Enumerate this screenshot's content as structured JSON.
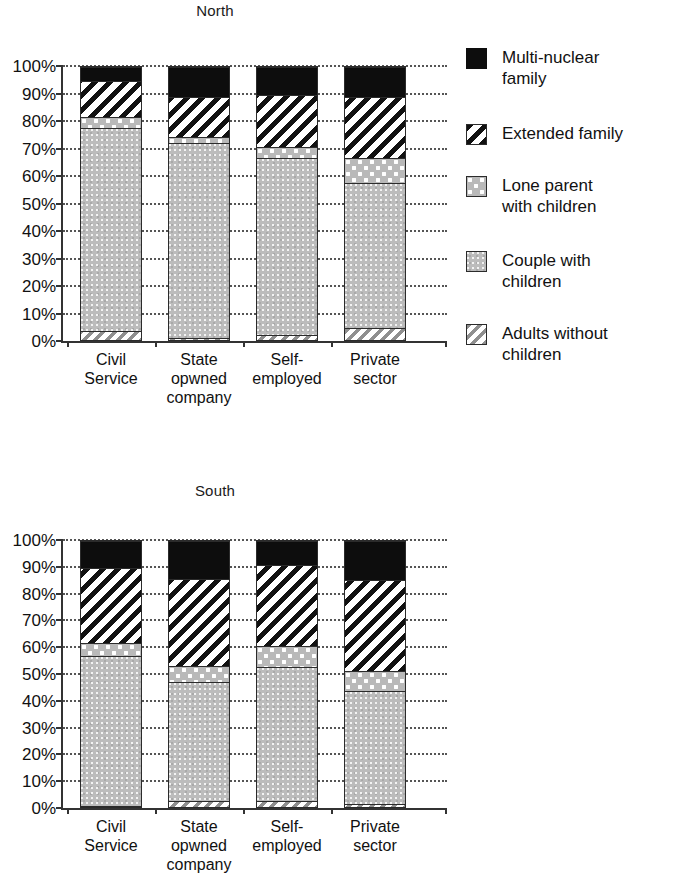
{
  "chart_data": [
    {
      "type": "bar",
      "title": "North",
      "xlabel": "",
      "ylabel": "",
      "ylim": [
        0,
        100
      ],
      "stacked": true,
      "grid": true,
      "legend_position": "right",
      "categories": [
        "Civil Service",
        "State opwned company",
        "Self-employed",
        "Private sector"
      ],
      "tick_labels": [
        "0%",
        "10%",
        "20%",
        "30%",
        "40%",
        "50%",
        "60%",
        "70%",
        "80%",
        "90%",
        "100%"
      ],
      "series": [
        {
          "name": "Adults without children",
          "values": [
            4,
            1.5,
            2.5,
            5
          ]
        },
        {
          "name": "Couple with children",
          "values": [
            74,
            71,
            64.5,
            53
          ]
        },
        {
          "name": "Lone parent with children",
          "values": [
            4,
            2,
            4,
            9
          ]
        },
        {
          "name": "Extended family",
          "values": [
            13,
            14.5,
            19,
            22
          ]
        },
        {
          "name": "Multi-nuclear family",
          "values": [
            5,
            11,
            10,
            11
          ]
        }
      ]
    },
    {
      "type": "bar",
      "title": "South",
      "xlabel": "",
      "ylabel": "",
      "ylim": [
        0,
        100
      ],
      "stacked": true,
      "grid": true,
      "legend_position": "right",
      "categories": [
        "Civil Service",
        "State opwned company",
        "Self-employed",
        "Private sector"
      ],
      "tick_labels": [
        "0%",
        "10%",
        "20%",
        "30%",
        "40%",
        "50%",
        "60%",
        "70%",
        "80%",
        "90%",
        "100%"
      ],
      "series": [
        {
          "name": "Adults without children",
          "values": [
            1,
            3,
            3,
            2
          ]
        },
        {
          "name": "Couple with children",
          "values": [
            56,
            44.5,
            50,
            42
          ]
        },
        {
          "name": "Lone parent with children",
          "values": [
            5,
            6,
            8,
            7.5
          ]
        },
        {
          "name": "Extended family",
          "values": [
            28,
            32.5,
            30,
            34
          ]
        },
        {
          "name": "Multi-nuclear family",
          "values": [
            10,
            14,
            9,
            14.5
          ]
        }
      ]
    }
  ],
  "legend": {
    "items": [
      {
        "label": "Multi-nuclear\nfamily",
        "pattern": "solid-black",
        "color": "#0d0d0d"
      },
      {
        "label": "Extended family",
        "pattern": "diagonal-hatch",
        "color": "#111111"
      },
      {
        "label": "Lone parent\nwith children",
        "pattern": "dotted-gray",
        "color": "#b9b9b9"
      },
      {
        "label": "Couple with\nchildren",
        "pattern": "solid-gray",
        "color": "#bcbcbc"
      },
      {
        "label": "Adults without\nchildren",
        "pattern": "light-diagonal-hatch",
        "color": "#8f8f8f"
      }
    ]
  },
  "x_category_lines": [
    [
      "Civil",
      "Service",
      ""
    ],
    [
      "State",
      "opwned",
      "company"
    ],
    [
      "Self-",
      "employed",
      ""
    ],
    [
      "Private",
      "sector",
      ""
    ]
  ]
}
